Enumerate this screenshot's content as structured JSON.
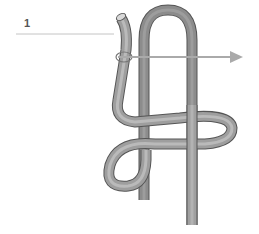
{
  "diagram": {
    "type": "knot-illustration",
    "step_label": "1",
    "arrow_direction": "right",
    "colors": {
      "rope_dark": "#6e6e6e",
      "rope_mid": "#9a9a9a",
      "rope_light": "#c8c8c8",
      "rope_outline": "#555555",
      "leader_line": "#bbbbbb",
      "arrow": "#a8a8a8"
    }
  }
}
